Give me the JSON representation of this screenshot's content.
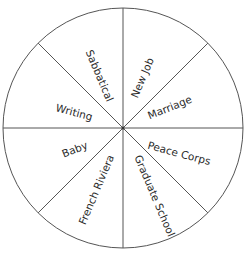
{
  "diagram": {
    "type": "wheel",
    "center": [
      123,
      128
    ],
    "radius": 120,
    "line_color": "#555555",
    "segments": [
      {
        "label": "New Job",
        "x": 143,
        "y": 78,
        "rotate": -67
      },
      {
        "label": "Marriage",
        "x": 170,
        "y": 108,
        "rotate": -22
      },
      {
        "label": "Peace Corps",
        "x": 179,
        "y": 154,
        "rotate": 15
      },
      {
        "label": "Graduate School",
        "x": 154,
        "y": 196,
        "rotate": 67
      },
      {
        "label": "French Riviera",
        "x": 97,
        "y": 190,
        "rotate": -67
      },
      {
        "label": "Baby",
        "x": 75,
        "y": 150,
        "rotate": -22
      },
      {
        "label": "Writing",
        "x": 74,
        "y": 113,
        "rotate": 15
      },
      {
        "label": "Sabbatical",
        "x": 99,
        "y": 76,
        "rotate": 67
      }
    ]
  }
}
